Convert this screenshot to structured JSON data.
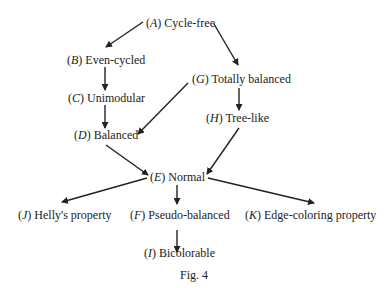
{
  "nodes": {
    "A": {
      "letter": "A",
      "label": "Cycle-free"
    },
    "B": {
      "letter": "B",
      "label": "Even-cycled"
    },
    "C": {
      "letter": "C",
      "label": "Unimodular"
    },
    "D": {
      "letter": "D",
      "label": "Balanced"
    },
    "E": {
      "letter": "E",
      "label": "Normal"
    },
    "F": {
      "letter": "F",
      "label": "Pseudo-balanced"
    },
    "G": {
      "letter": "G",
      "label": "Totally balanced"
    },
    "H": {
      "letter": "H",
      "label": "Tree-like"
    },
    "I": {
      "letter": "I",
      "label": "Bicolorable"
    },
    "J": {
      "letter": "J",
      "label": "Helly's property"
    },
    "K": {
      "letter": "K",
      "label": "Edge-coloring property"
    }
  },
  "edges": [
    [
      "A",
      "B"
    ],
    [
      "A",
      "G"
    ],
    [
      "B",
      "C"
    ],
    [
      "C",
      "D"
    ],
    [
      "G",
      "D"
    ],
    [
      "G",
      "H"
    ],
    [
      "D",
      "E"
    ],
    [
      "H",
      "E"
    ],
    [
      "E",
      "J"
    ],
    [
      "E",
      "F"
    ],
    [
      "E",
      "K"
    ],
    [
      "F",
      "I"
    ]
  ],
  "caption": "Fig. 4"
}
